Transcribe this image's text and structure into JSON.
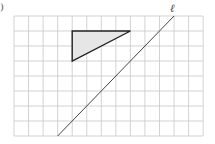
{
  "figure": {
    "part_label": ")",
    "line_label": "ℓ",
    "grid": {
      "columns": 13,
      "rows": 8,
      "left": 14,
      "top": 16,
      "cell_width": 14.55,
      "cell_height": 15,
      "line_color": "#c8c8c8"
    },
    "triangle": {
      "vertices_grid": [
        [
          4,
          1
        ],
        [
          8,
          1
        ],
        [
          4,
          3
        ]
      ],
      "fill": "#e6e6e6",
      "stroke": "#222222"
    },
    "line_l": {
      "from_grid": [
        3,
        8
      ],
      "to_grid": [
        11,
        0
      ],
      "stroke": "#444444"
    }
  }
}
